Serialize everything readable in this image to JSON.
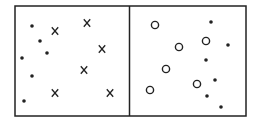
{
  "diagram": {
    "stroke_color": "#222222",
    "background": "#ffffff",
    "frame": {
      "x": 15,
      "y": 6,
      "width": 231,
      "height": 110
    },
    "divider_x": 129.5,
    "left_panel": {
      "dots": [
        {
          "x": 32,
          "y": 26
        },
        {
          "x": 40,
          "y": 41
        },
        {
          "x": 47,
          "y": 53
        },
        {
          "x": 22,
          "y": 58
        },
        {
          "x": 32,
          "y": 76
        },
        {
          "x": 24,
          "y": 101
        }
      ],
      "crosses": [
        {
          "x": 55,
          "y": 31
        },
        {
          "x": 87,
          "y": 23
        },
        {
          "x": 102,
          "y": 49
        },
        {
          "x": 84,
          "y": 70
        },
        {
          "x": 55,
          "y": 93
        },
        {
          "x": 110,
          "y": 93
        }
      ]
    },
    "right_panel": {
      "circles": [
        {
          "x": 155,
          "y": 25
        },
        {
          "x": 179,
          "y": 47
        },
        {
          "x": 206,
          "y": 41
        },
        {
          "x": 166,
          "y": 69
        },
        {
          "x": 150,
          "y": 90
        },
        {
          "x": 197,
          "y": 84
        }
      ],
      "dots": [
        {
          "x": 211,
          "y": 22
        },
        {
          "x": 228,
          "y": 45
        },
        {
          "x": 206,
          "y": 60
        },
        {
          "x": 215,
          "y": 80
        },
        {
          "x": 207,
          "y": 96
        },
        {
          "x": 221,
          "y": 107
        }
      ]
    }
  }
}
